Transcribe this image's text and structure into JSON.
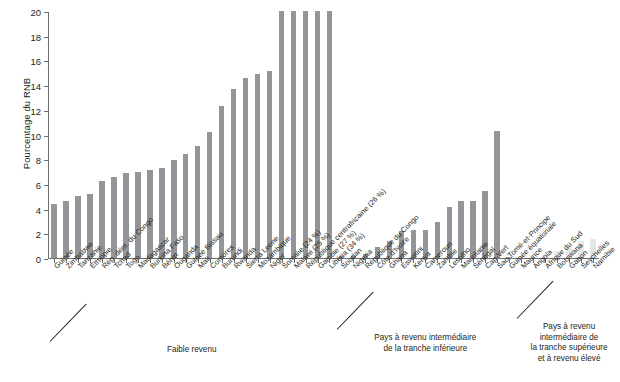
{
  "chart_data": {
    "type": "bar",
    "title": "",
    "xlabel": "",
    "ylabel": "Pourcentage du RNB",
    "ylim": [
      0,
      20
    ],
    "yticks": [
      0,
      2,
      4,
      6,
      8,
      10,
      12,
      14,
      16,
      18,
      20
    ],
    "grid": false,
    "legend": "none",
    "note_clipped": "Les barres dépassant 20 % sont tronquées; la valeur réelle figure entre parenthèses.",
    "groups": [
      {
        "name": "Faible revenu",
        "caption": "Faible revenu",
        "start": 0,
        "end": 23,
        "color": "#939598"
      },
      {
        "name": "Pays à revenu intermédiaire de la tranche inférieure",
        "caption": "Pays à revenu intermédiaire\nde la tranche inférieure",
        "start": 24,
        "end": 38,
        "color": "#939598"
      },
      {
        "name": "Pays à revenu intermédiaire de la tranche supérieure et à revenu élevé",
        "caption": "Pays à revenu\nintermédiaire de\nla tranche supérieure\net à revenu élevé",
        "start": 39,
        "end": 47,
        "color": "#e6e7e8"
      }
    ],
    "categories": [
      "Guinée",
      "Zimbabwe",
      "Tanzanie",
      "Éthiopie",
      "Rép. dém. du Congo",
      "Tchad",
      "Togo",
      "Madagascar",
      "Burkina Faso",
      "Bénin",
      "Ouganda",
      "Guinée Bissau",
      "Mali",
      "Comores",
      "Burundi",
      "Rwanda",
      "Sierra Leone",
      "Mozambique",
      "Niger",
      "Somalie (24 %)",
      "Malawi (25 %)",
      "République centrafricaine (26 %)",
      "Gambie (27 %)",
      "Libéria (34 %)",
      "Soudan",
      "Nigeria",
      "République du Congo",
      "Côte d'Ivoire",
      "Ghana",
      "Eswatini",
      "Kenya",
      "Cameroun",
      "Zambie",
      "Lesotho",
      "Mauritanie",
      "Sénégal",
      "Cap-Vert",
      "Sao Tomé-et-Principe",
      "Guinée équatoriale",
      "Maurice",
      "Angola",
      "Afrique du Sud",
      "Botswana",
      "Gabon",
      "Seychelles",
      "Namibie"
    ],
    "values": [
      4.35,
      4.6,
      5.0,
      5.15,
      6.25,
      6.55,
      6.9,
      7.0,
      7.1,
      7.3,
      7.95,
      8.4,
      9.1,
      10.2,
      12.3,
      13.7,
      14.6,
      14.9,
      15.15,
      20,
      20,
      20,
      20,
      20,
      0.15,
      0.2,
      0.35,
      0.9,
      1.35,
      2.2,
      2.25,
      2.25,
      2.95,
      4.1,
      4.6,
      4.65,
      5.45,
      10.3,
      0.1,
      0.05,
      0.05,
      0.25,
      0.55,
      0.9,
      1.4,
      1.5
    ],
    "clipped_values": {
      "Somalie (24 %)": 24,
      "Malawi (25 %)": 25,
      "République centrafricaine (26 %)": 26,
      "Gambie (27 %)": 27,
      "Libéria (34 %)": 34
    }
  }
}
